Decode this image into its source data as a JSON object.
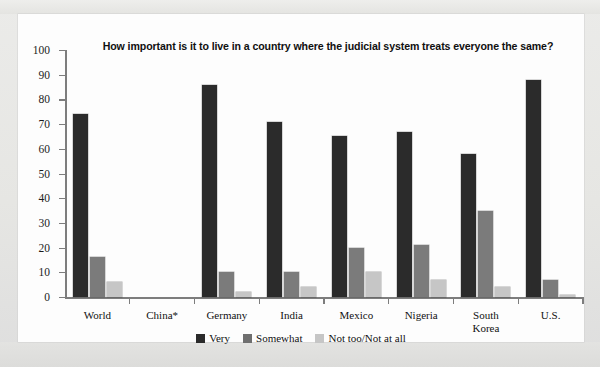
{
  "chart_data": {
    "type": "bar",
    "title": "How important is it to live in a country where the judicial system treats everyone the same?",
    "xlabel": "",
    "ylabel": "",
    "ylim": [
      0,
      100
    ],
    "ytick_labels": [
      "100",
      "90",
      "80",
      "70",
      "60",
      "50",
      "40",
      "30",
      "20",
      "10",
      "0"
    ],
    "yticks": [
      100,
      90,
      80,
      70,
      60,
      50,
      40,
      30,
      20,
      10,
      0
    ],
    "grid": false,
    "legend_position": "bottom",
    "categories": [
      "World",
      "China*",
      "Germany",
      "India",
      "Mexico",
      "Nigeria",
      "South Korea",
      "U.S."
    ],
    "series": [
      {
        "name": "Very",
        "color": "#2b2b2b",
        "values": [
          74,
          null,
          86,
          71,
          65,
          67,
          58,
          88
        ]
      },
      {
        "name": "Somewhat",
        "color": "#7b7b7b",
        "values": [
          16,
          null,
          10,
          10,
          20,
          21,
          35,
          7
        ]
      },
      {
        "name": "Not too/Not at all",
        "color": "#c6c6c6",
        "values": [
          6,
          null,
          2,
          4,
          10,
          7,
          4,
          1
        ]
      }
    ]
  },
  "legend": {
    "items": [
      {
        "label": "Very",
        "swatch": "very-swatch"
      },
      {
        "label": "Somewhat",
        "swatch": "somewhat-swatch"
      },
      {
        "label": "Not too/Not at all",
        "swatch": "not-too-swatch"
      }
    ]
  }
}
